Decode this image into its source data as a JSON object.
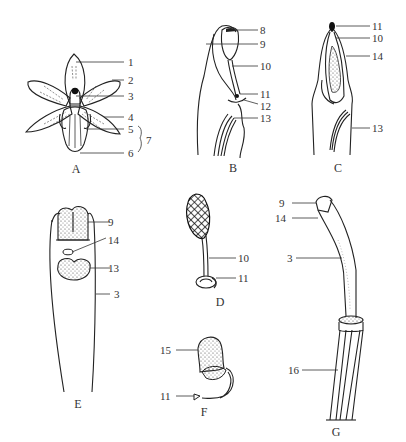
{
  "figure": {
    "type": "botanical-diagram",
    "panels": [
      {
        "id": "A",
        "label": "A",
        "callouts": [
          "1",
          "2",
          "3",
          "4",
          "5",
          "6"
        ],
        "bracket_label": "7"
      },
      {
        "id": "B",
        "label": "B",
        "callouts": [
          "8",
          "9",
          "10",
          "11",
          "12",
          "13"
        ]
      },
      {
        "id": "C",
        "label": "C",
        "callouts": [
          "11",
          "10",
          "14",
          "13"
        ]
      },
      {
        "id": "D",
        "label": "D",
        "callouts": [
          "10",
          "11"
        ]
      },
      {
        "id": "E",
        "label": "E",
        "callouts": [
          "9",
          "14",
          "13",
          "3"
        ]
      },
      {
        "id": "F",
        "label": "F",
        "callouts": [
          "15",
          "11"
        ]
      },
      {
        "id": "G",
        "label": "G",
        "callouts": [
          "9",
          "14",
          "3",
          "16"
        ]
      }
    ]
  },
  "labels": {
    "A": {
      "panel": "A",
      "c1": "1",
      "c2": "2",
      "c3": "3",
      "c4": "4",
      "c5": "5",
      "c6": "6",
      "c7": "7"
    },
    "B": {
      "panel": "B",
      "c8": "8",
      "c9": "9",
      "c10": "10",
      "c11": "11",
      "c12": "12",
      "c13": "13"
    },
    "C": {
      "panel": "C",
      "c11": "11",
      "c10": "10",
      "c14": "14",
      "c13": "13"
    },
    "D": {
      "panel": "D",
      "c10": "10",
      "c11": "11"
    },
    "E": {
      "panel": "E",
      "c9": "9",
      "c14": "14",
      "c13": "13",
      "c3": "3"
    },
    "F": {
      "panel": "F",
      "c15": "15",
      "c11": "11"
    },
    "G": {
      "panel": "G",
      "c9": "9",
      "c14": "14",
      "c3": "3",
      "c16": "16"
    }
  }
}
